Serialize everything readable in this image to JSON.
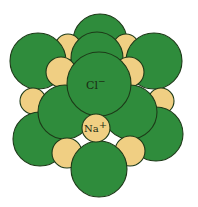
{
  "diagram": {
    "colors": {
      "chloride": "#2f8c3c",
      "sodium": "#f0cf83",
      "outline": "#1d3a18",
      "background": "#ffffff"
    },
    "labels": {
      "chloride_symbol": "Cl",
      "chloride_charge": "−",
      "sodium_symbol": "Na",
      "sodium_charge": "+"
    },
    "atoms": [
      {
        "id": "cl-back-top",
        "type": "Cl",
        "cx": 100,
        "cy": 41,
        "r": 27
      },
      {
        "id": "na-back-ul",
        "type": "Na",
        "cx": 68,
        "cy": 47,
        "r": 13
      },
      {
        "id": "na-back-ur",
        "type": "Na",
        "cx": 126,
        "cy": 47,
        "r": 13
      },
      {
        "id": "cl-top-left",
        "type": "Cl",
        "cx": 38,
        "cy": 61,
        "r": 28
      },
      {
        "id": "cl-top-right",
        "type": "Cl",
        "cx": 154,
        "cy": 61,
        "r": 28
      },
      {
        "id": "cl-mid-back",
        "type": "Cl",
        "cx": 97,
        "cy": 58,
        "r": 26
      },
      {
        "id": "na-back-left",
        "type": "Na",
        "cx": 33,
        "cy": 101,
        "r": 13
      },
      {
        "id": "na-back-right",
        "type": "Na",
        "cx": 161,
        "cy": 101,
        "r": 13
      },
      {
        "id": "cl-bottom-left",
        "type": "Cl",
        "cx": 40,
        "cy": 139,
        "r": 27
      },
      {
        "id": "cl-bottom-right",
        "type": "Cl",
        "cx": 156,
        "cy": 134,
        "r": 27
      },
      {
        "id": "na-front-ul",
        "type": "Na",
        "cx": 61,
        "cy": 72,
        "r": 15
      },
      {
        "id": "na-front-ur",
        "type": "Na",
        "cx": 129,
        "cy": 72,
        "r": 15
      },
      {
        "id": "cl-mid-left",
        "type": "Cl",
        "cx": 65,
        "cy": 112,
        "r": 27
      },
      {
        "id": "cl-mid-right",
        "type": "Cl",
        "cx": 130,
        "cy": 112,
        "r": 27
      },
      {
        "id": "na-bottom-left",
        "type": "Na",
        "cx": 67,
        "cy": 153,
        "r": 15
      },
      {
        "id": "na-bottom-right",
        "type": "Na",
        "cx": 130,
        "cy": 151,
        "r": 15
      },
      {
        "id": "cl-front-center",
        "type": "Cl",
        "cx": 99,
        "cy": 84,
        "r": 32,
        "labeled": true
      },
      {
        "id": "cl-bottom-front",
        "type": "Cl",
        "cx": 99,
        "cy": 169,
        "r": 28
      },
      {
        "id": "na-front-center",
        "type": "Na",
        "cx": 96,
        "cy": 128,
        "r": 14,
        "labeled": true
      }
    ]
  }
}
